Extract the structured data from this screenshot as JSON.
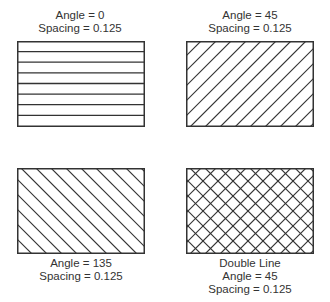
{
  "figure": {
    "stroke_color": "#333333",
    "background": "#ffffff",
    "panels": [
      {
        "id": "angle-0",
        "lines": [
          "Angle = 0",
          "Spacing = 0.125"
        ],
        "angle": 0,
        "spacing": 0.125,
        "double": false,
        "label_position": "top"
      },
      {
        "id": "angle-45",
        "lines": [
          "Angle = 45",
          "Spacing = 0.125"
        ],
        "angle": 45,
        "spacing": 0.125,
        "double": false,
        "label_position": "top"
      },
      {
        "id": "angle-135",
        "lines": [
          "Angle = 135",
          "Spacing = 0.125"
        ],
        "angle": 135,
        "spacing": 0.125,
        "double": false,
        "label_position": "bottom"
      },
      {
        "id": "double-line-45",
        "lines": [
          "Double Line",
          "Angle = 45",
          "Spacing = 0.125"
        ],
        "angle": 45,
        "spacing": 0.125,
        "double": true,
        "label_position": "bottom"
      }
    ]
  }
}
